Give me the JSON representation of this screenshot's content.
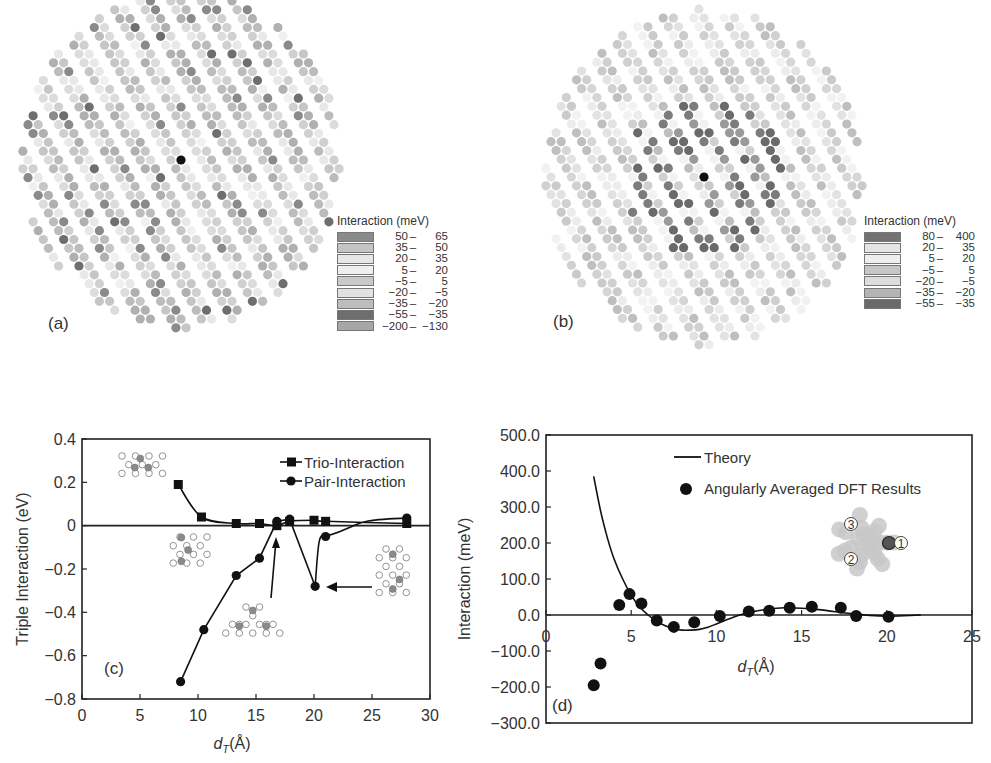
{
  "panels": {
    "a": {
      "label": "(a)",
      "legend_title": "Interaction (meV)",
      "legend": [
        {
          "lo": "50",
          "hi": "65",
          "color": "#8a8a8a"
        },
        {
          "lo": "35",
          "hi": "50",
          "color": "#c4c4c4"
        },
        {
          "lo": "20",
          "hi": "35",
          "color": "#e6e6e6"
        },
        {
          "lo": "5",
          "hi": "20",
          "color": "#efefef"
        },
        {
          "lo": "−5",
          "hi": "5",
          "color": "#c9c9c9"
        },
        {
          "lo": "−20",
          "hi": "−5",
          "color": "#e2e2e2"
        },
        {
          "lo": "−35",
          "hi": "−20",
          "color": "#bdbdbd"
        },
        {
          "lo": "−55",
          "hi": "−35",
          "color": "#6e6e6e"
        },
        {
          "lo": "−200",
          "hi": "−130",
          "color": "#a6a6a6"
        }
      ]
    },
    "b": {
      "label": "(b)",
      "legend_title": "Interaction (meV)",
      "legend": [
        {
          "lo": "80",
          "hi": "400",
          "color": "#727272"
        },
        {
          "lo": "20",
          "hi": "35",
          "color": "#e4e4e4"
        },
        {
          "lo": "5",
          "hi": "20",
          "color": "#eeeeee"
        },
        {
          "lo": "−5",
          "hi": "5",
          "color": "#c6c6c6"
        },
        {
          "lo": "−20",
          "hi": "−5",
          "color": "#dddddd"
        },
        {
          "lo": "−35",
          "hi": "−20",
          "color": "#b4b4b4"
        },
        {
          "lo": "−55",
          "hi": "−35",
          "color": "#6a6a6a"
        }
      ]
    },
    "c": {
      "label": "(c)"
    },
    "d": {
      "label": "(d)"
    }
  },
  "chart_data": [
    {
      "id": "c",
      "type": "line",
      "title": "",
      "xlabel": "d_T(Å)",
      "ylabel": "Triple Interaction (eV)",
      "xlim": [
        0,
        30
      ],
      "ylim": [
        -0.8,
        0.4
      ],
      "xticks": [
        0,
        5,
        10,
        15,
        20,
        25,
        30
      ],
      "xtick_labels": [
        "0",
        "5",
        "10",
        "15",
        "20",
        "25",
        "30"
      ],
      "yticks": [
        0.4,
        0.2,
        0,
        -0.2,
        -0.4,
        -0.6,
        -0.8
      ],
      "ytick_labels": [
        "0.4",
        "0.2",
        "0",
        "−0.2",
        "−0.4",
        "−0.6",
        "−0.8"
      ],
      "grid": false,
      "legend_position": "upper right",
      "series": [
        {
          "name": "Trio-Interaction",
          "marker": "square",
          "x": [
            8.3,
            10.3,
            13.3,
            15.3,
            16.8,
            17.9,
            20.0,
            21.0,
            28.0
          ],
          "y": [
            0.19,
            0.04,
            0.01,
            0.01,
            0.0,
            0.02,
            0.025,
            0.02,
            0.01
          ]
        },
        {
          "name": "Pair-Interaction",
          "marker": "circle",
          "x": [
            8.5,
            10.5,
            13.3,
            15.3,
            16.8,
            17.9,
            20.1,
            21.0,
            28.0
          ],
          "y": [
            -0.72,
            -0.48,
            -0.23,
            -0.15,
            0.02,
            0.03,
            -0.28,
            -0.05,
            0.035
          ]
        }
      ],
      "annotations": [
        {
          "text": "arrow to d≈17 Å crossing",
          "type": "arrow"
        },
        {
          "text": "arrow to d≈20 Å minimum",
          "type": "arrow"
        }
      ],
      "zero_line": true
    },
    {
      "id": "d",
      "type": "scatter",
      "title": "",
      "xlabel": "d_T(Å)",
      "ylabel": "Interaction (meV)",
      "xlim": [
        0,
        25
      ],
      "ylim": [
        -300,
        500
      ],
      "xticks": [
        0,
        5,
        10,
        15,
        20,
        25
      ],
      "xtick_labels": [
        "0",
        "5",
        "10",
        "15",
        "20",
        "25"
      ],
      "yticks": [
        500,
        400,
        300,
        200,
        100,
        0,
        -100,
        -200,
        -300
      ],
      "ytick_labels": [
        "500.0",
        "400.0",
        "300.0",
        "200.0",
        "100.0",
        "0.0",
        "−100.0",
        "−200.0",
        "−300.0"
      ],
      "grid": false,
      "legend_position": "upper right",
      "series": [
        {
          "name": "Theory",
          "style": "line",
          "x": [
            2.8,
            3.2,
            3.6,
            4.0,
            4.5,
            5.0,
            5.5,
            6.0,
            6.5,
            7.0,
            7.5,
            8.0,
            8.5,
            9.0,
            9.5,
            10.0,
            10.5,
            11.0,
            11.5,
            12.0,
            13.0,
            14.0,
            15.0,
            16.0,
            17.0,
            18.0,
            19.0,
            20.0,
            21.0,
            22.0
          ],
          "y": [
            385,
            290,
            215,
            155,
            100,
            55,
            22,
            0,
            -18,
            -30,
            -38,
            -42,
            -42,
            -40,
            -34,
            -25,
            -15,
            -6,
            2,
            8,
            16,
            20,
            19,
            15,
            9,
            3,
            -1,
            -3,
            -2,
            0
          ]
        },
        {
          "name": "Angularly Averaged DFT Results",
          "style": "markers",
          "x": [
            2.8,
            3.2,
            4.3,
            4.9,
            5.6,
            6.5,
            7.5,
            8.7,
            10.2,
            11.9,
            13.1,
            14.3,
            15.6,
            17.3,
            18.2,
            20.1
          ],
          "y": [
            -195,
            -135,
            28,
            58,
            32,
            -15,
            -33,
            -20,
            -3,
            10,
            12,
            20,
            23,
            20,
            -3,
            -5
          ]
        }
      ],
      "inset_labels": [
        "3",
        "1",
        "2"
      ],
      "zero_line": true
    }
  ]
}
